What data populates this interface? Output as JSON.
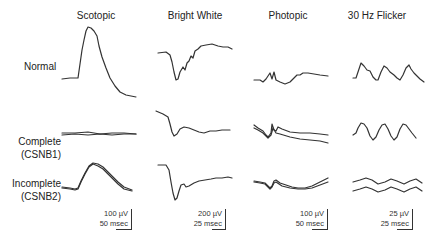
{
  "figure": {
    "columns": [
      {
        "label": "Scotopic"
      },
      {
        "label": "Bright White"
      },
      {
        "label": "Photopic"
      },
      {
        "label": "30 Hz Flicker"
      }
    ],
    "rows": [
      {
        "line1": "Normal",
        "line2": ""
      },
      {
        "line1": "Complete",
        "line2": "(CSNB1)"
      },
      {
        "line1": "Incomplete",
        "line2": "(CSNB2)"
      }
    ],
    "scale_bars": [
      {
        "amplitude": "100 µV",
        "time": "50 msec"
      },
      {
        "amplitude": "200 µV",
        "time": "25 msec"
      },
      {
        "amplitude": "100 µV",
        "time": "50 msec"
      },
      {
        "amplitude": "25 µV",
        "time": "25 msec"
      }
    ],
    "stroke_color": "#333333"
  }
}
